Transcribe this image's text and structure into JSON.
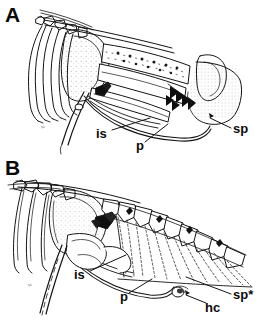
{
  "figure": {
    "kind": "anatomical-line-drawing",
    "background_color": "#ffffff",
    "ink_color": "#111111",
    "panel_count": 2
  },
  "panels": [
    {
      "id": "A",
      "letter": "A",
      "tiny_mark": "sc",
      "labels": [
        {
          "key": "is",
          "text": "is",
          "leader": true
        },
        {
          "key": "p",
          "text": "p",
          "leader": true
        },
        {
          "key": "sp",
          "text": "sp",
          "leader": true
        }
      ]
    },
    {
      "id": "B",
      "letter": "B",
      "tiny_mark": "sc",
      "labels": [
        {
          "key": "is",
          "text": "is",
          "leader": true
        },
        {
          "key": "p",
          "text": "p",
          "leader": true
        },
        {
          "key": "sp*",
          "text": "sp*",
          "leader": true
        },
        {
          "key": "hc",
          "text": "hc",
          "leader": true
        }
      ]
    }
  ]
}
